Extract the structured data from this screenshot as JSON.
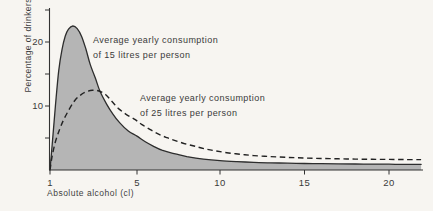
{
  "figure": {
    "background": "#f7f5f1",
    "ink": "#333333",
    "area_fill": "#b5b5b5"
  },
  "chart_data": {
    "type": "area",
    "title": "",
    "xlabel": "Absolute alcohol (cl)",
    "ylabel": "Percentage of drinkers",
    "xlim": [
      1,
      22
    ],
    "ylim": [
      0,
      25
    ],
    "grid": false,
    "x_ticks": [
      1,
      5,
      10,
      15,
      20
    ],
    "x_tick_labels": [
      "1",
      "5",
      "10",
      "15",
      "20"
    ],
    "y_ticks": [
      5,
      10,
      15,
      20,
      25
    ],
    "y_tick_labels": {
      "10": "10",
      "20": "20"
    },
    "series": [
      {
        "name": "Average yearly consumption of 15 litres per person",
        "style": "solid-filled",
        "points": [
          [
            1,
            0
          ],
          [
            1.1,
            4
          ],
          [
            1.25,
            10
          ],
          [
            1.4,
            15.5
          ],
          [
            1.55,
            18.8
          ],
          [
            1.7,
            20.9
          ],
          [
            1.85,
            22.0
          ],
          [
            2.05,
            22.5
          ],
          [
            2.25,
            22.1
          ],
          [
            2.45,
            20.9
          ],
          [
            2.65,
            18.9
          ],
          [
            2.85,
            16.5
          ],
          [
            3.1,
            14.2
          ],
          [
            3.3,
            12.3
          ],
          [
            3.6,
            10.3
          ],
          [
            3.9,
            8.7
          ],
          [
            4.2,
            7.4
          ],
          [
            4.6,
            6.1
          ],
          [
            5,
            5.3
          ],
          [
            5.5,
            4.4
          ],
          [
            6,
            3.7
          ],
          [
            6.5,
            3.1
          ],
          [
            7,
            2.7
          ],
          [
            7.5,
            2.4
          ],
          [
            8,
            2.1
          ],
          [
            9,
            1.7
          ],
          [
            10,
            1.45
          ],
          [
            11,
            1.3
          ],
          [
            12,
            1.2
          ],
          [
            13,
            1.12
          ],
          [
            14,
            1.07
          ],
          [
            15,
            1.02
          ],
          [
            16,
            0.99
          ],
          [
            17,
            0.96
          ],
          [
            18,
            0.94
          ],
          [
            19,
            0.92
          ],
          [
            20,
            0.9
          ],
          [
            21,
            0.88
          ],
          [
            21.9,
            0.87
          ]
        ]
      },
      {
        "name": "Average yearly consumption of 25 litres per person",
        "style": "dashed",
        "points": [
          [
            1,
            0
          ],
          [
            1.1,
            2.2
          ],
          [
            1.25,
            4.4
          ],
          [
            1.45,
            6.4
          ],
          [
            1.65,
            8.0
          ],
          [
            1.9,
            9.6
          ],
          [
            2.15,
            10.9
          ],
          [
            2.4,
            11.7
          ],
          [
            2.65,
            12.2
          ],
          [
            2.95,
            12.45
          ],
          [
            3.25,
            12.35
          ],
          [
            3.55,
            11.8
          ],
          [
            3.85,
            10.7
          ],
          [
            4.15,
            9.6
          ],
          [
            4.5,
            8.7
          ],
          [
            4.9,
            7.9
          ],
          [
            5.3,
            7.1
          ],
          [
            5.8,
            6.3
          ],
          [
            6.3,
            5.6
          ],
          [
            6.8,
            5.05
          ],
          [
            7.3,
            4.6
          ],
          [
            7.9,
            4.1
          ],
          [
            8.5,
            3.7
          ],
          [
            9.1,
            3.3
          ],
          [
            9.7,
            3.0
          ],
          [
            10.4,
            2.7
          ],
          [
            11.2,
            2.45
          ],
          [
            12,
            2.25
          ],
          [
            13,
            2.1
          ],
          [
            14,
            1.97
          ],
          [
            15,
            1.87
          ],
          [
            16,
            1.8
          ],
          [
            17,
            1.75
          ],
          [
            18,
            1.7
          ],
          [
            19,
            1.67
          ],
          [
            20,
            1.65
          ],
          [
            21,
            1.63
          ],
          [
            21.9,
            1.62
          ]
        ]
      }
    ],
    "annotations": [
      {
        "line1": "Average yearly consumption",
        "line2": "of 15 litres per person",
        "refers_to": "15-litre curve"
      },
      {
        "line1": "Average yearly consumption",
        "line2": "of 25 litres per person",
        "refers_to": "25-litre curve"
      }
    ]
  }
}
